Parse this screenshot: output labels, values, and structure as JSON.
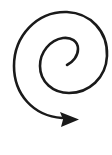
{
  "icon": {
    "name": "spiral-arrow",
    "stroke_color": "#1a1a1a",
    "background": "#ffffff",
    "stroke_width": 2.6,
    "description": "Spiral arrow"
  }
}
